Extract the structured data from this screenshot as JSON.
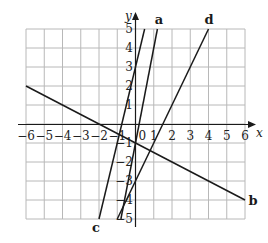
{
  "chart_data": {
    "type": "line",
    "title": "",
    "xlabel": "x",
    "ylabel": "y",
    "xlim": [
      -6,
      6
    ],
    "ylim": [
      -5,
      5
    ],
    "grid": true,
    "x_ticks": [
      -6,
      -5,
      -4,
      -3,
      -2,
      -1,
      0,
      1,
      2,
      3,
      4,
      5,
      6
    ],
    "y_ticks": [
      -5,
      -4,
      -3,
      -2,
      -1,
      1,
      2,
      3,
      4,
      5
    ],
    "origin_label": "0",
    "series": [
      {
        "name": "a",
        "equation": "y = 5x - 1",
        "points": [
          [
            -0.8,
            -5
          ],
          [
            1.2,
            5
          ]
        ]
      },
      {
        "name": "b",
        "equation": "y = -0.5x - 1",
        "points": [
          [
            -6,
            2
          ],
          [
            6,
            -4
          ]
        ]
      },
      {
        "name": "c",
        "equation": "y = 4x + 3",
        "points": [
          [
            -2,
            -5
          ],
          [
            0.5,
            5
          ]
        ]
      },
      {
        "name": "d",
        "equation": "y = 2x - 3",
        "points": [
          [
            -1,
            -5
          ],
          [
            4,
            5
          ]
        ]
      }
    ],
    "legend": "inline labels at line ends"
  }
}
